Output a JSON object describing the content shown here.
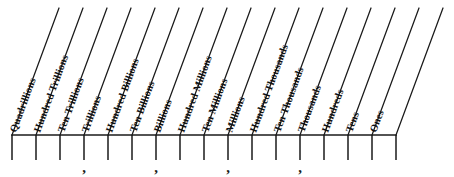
{
  "diagram": {
    "type": "place-value-chart",
    "orientation": "slanted-columns",
    "background_color": "#ffffff",
    "ink_color": "#1a1a1a",
    "column_count": 16,
    "divider_line_count": 17,
    "columns": [
      {
        "index": 0,
        "label": "Quadrillions"
      },
      {
        "index": 1,
        "label": "Hundred Trillions"
      },
      {
        "index": 2,
        "label": "Ten Trillions"
      },
      {
        "index": 3,
        "label": "Trillions"
      },
      {
        "index": 4,
        "label": "Hundred Billions"
      },
      {
        "index": 5,
        "label": "Ten Billions"
      },
      {
        "index": 6,
        "label": "Billions"
      },
      {
        "index": 7,
        "label": "Hundred Millions"
      },
      {
        "index": 8,
        "label": "Ten Millions"
      },
      {
        "index": 9,
        "label": "Millions"
      },
      {
        "index": 10,
        "label": "Hundred Thousands"
      },
      {
        "index": 11,
        "label": "Ten Thousands"
      },
      {
        "index": 12,
        "label": "Thousands"
      },
      {
        "index": 13,
        "label": "Hundreds"
      },
      {
        "index": 14,
        "label": "Tens"
      },
      {
        "index": 15,
        "label": "Ones"
      }
    ],
    "commas": [
      {
        "index": 0,
        "glyph": ",",
        "after_column": 2
      },
      {
        "index": 1,
        "glyph": ",",
        "after_column": 5
      },
      {
        "index": 2,
        "glyph": ",",
        "after_column": 8
      },
      {
        "index": 3,
        "glyph": ",",
        "after_column": 11
      }
    ],
    "geometry": {
      "baseline_y": 135,
      "baseline_x_start": 12,
      "baseline_x_end": 396,
      "tick_bottom_y": 160,
      "comma_y": 172,
      "column_pitch": 24,
      "slant_top_y": 8,
      "slant_dx": 47
    }
  }
}
